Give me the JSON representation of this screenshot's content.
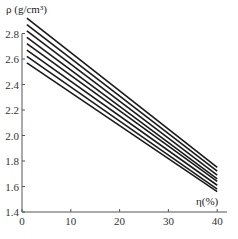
{
  "chart_data": {
    "type": "line",
    "title": "",
    "xlabel": "η(%)",
    "ylabel": "ρ (g/cm³)",
    "xlim": [
      0,
      42
    ],
    "ylim": [
      1.4,
      2.95
    ],
    "xticks": [
      0,
      10,
      20,
      30,
      40
    ],
    "xtick_labels": [
      "0",
      "10",
      "20",
      "30",
      "40"
    ],
    "yticks": [
      1.4,
      1.6,
      1.8,
      2.0,
      2.2,
      2.4,
      2.6,
      2.8
    ],
    "ytick_labels": [
      "1.4",
      "1.6",
      "1.8",
      "2.0",
      "2.2",
      "2.4",
      "2.6",
      "2.8"
    ],
    "grid": false,
    "legend": null,
    "x": [
      1,
      40
    ],
    "series": [
      {
        "name": "line 1",
        "values": [
          2.92,
          1.75
        ]
      },
      {
        "name": "line 2",
        "values": [
          2.87,
          1.72
        ]
      },
      {
        "name": "line 3",
        "values": [
          2.82,
          1.69
        ]
      },
      {
        "name": "line 4",
        "values": [
          2.77,
          1.66
        ]
      },
      {
        "name": "line 5",
        "values": [
          2.72,
          1.64
        ]
      },
      {
        "name": "line 6",
        "values": [
          2.67,
          1.61
        ]
      },
      {
        "name": "line 7",
        "values": [
          2.62,
          1.58
        ]
      },
      {
        "name": "line 8",
        "values": [
          2.57,
          1.56
        ]
      }
    ]
  }
}
